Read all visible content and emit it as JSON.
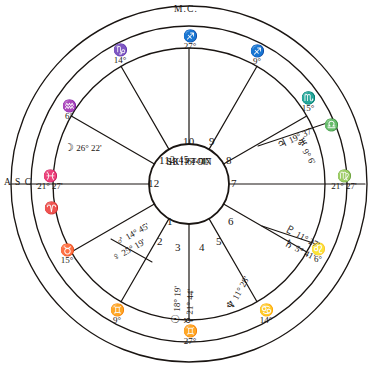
{
  "figure": {
    "ink_color": "#1a1512",
    "paper_color": "#ffffff"
  },
  "center": {
    "time": "2·45 a.m.",
    "date": "10 · 6 · 47",
    "place": "SKIPTON"
  },
  "angles": {
    "mc_label": "M.C.",
    "asc_label": "A S C ."
  },
  "house_numbers": [
    "1",
    "2",
    "3",
    "4",
    "5",
    "6",
    "7",
    "8",
    "9",
    "10",
    "11",
    "12"
  ],
  "cusps": [
    {
      "house": "10",
      "glyph": "♐",
      "degree": "27°",
      "name": "mc-sagittarius"
    },
    {
      "house": "11",
      "glyph": "♑",
      "degree": "14°",
      "name": "cusp-capricorn"
    },
    {
      "house": "12",
      "glyph": "♒",
      "degree": "6°",
      "name": "cusp-aquarius"
    },
    {
      "house": "1",
      "glyph": "♓",
      "degree": "21° 27'",
      "name": "asc-pisces"
    },
    {
      "house": "2",
      "glyph": "♈",
      "degree": "",
      "name": "cusp-aries"
    },
    {
      "house": "3",
      "glyph": "♉",
      "degree": "15°",
      "name": "cusp-taurus"
    },
    {
      "house": "4",
      "glyph": "♊",
      "degree": "9°",
      "name": "cusp-gemini-lower-left"
    },
    {
      "house": "4b",
      "glyph": "♊",
      "degree": "27°",
      "name": "ic-gemini"
    },
    {
      "house": "5",
      "glyph": "♋",
      "degree": "14°",
      "name": "cusp-cancer"
    },
    {
      "house": "6",
      "glyph": "♌",
      "degree": "6°",
      "name": "cusp-leo"
    },
    {
      "house": "7",
      "glyph": "♍",
      "degree": "21° 27'",
      "name": "desc-virgo"
    },
    {
      "house": "8",
      "glyph": "♎",
      "degree": "",
      "name": "cusp-libra"
    },
    {
      "house": "9",
      "glyph": "♏",
      "degree": "15°",
      "name": "cusp-scorpio"
    },
    {
      "house": "9b",
      "glyph": "♐",
      "degree": "9°",
      "name": "cusp-sagittarius-upper-right"
    }
  ],
  "planets": [
    {
      "name": "moon",
      "glyph": "☽",
      "position": "26° 22'",
      "house": "12"
    },
    {
      "name": "mars",
      "glyph": "♂",
      "position": "14° 45'",
      "house": "2"
    },
    {
      "name": "venus",
      "glyph": "♀",
      "position": "25° 19'",
      "house": "2"
    },
    {
      "name": "sun",
      "glyph": "☉",
      "position": "18° 19'",
      "house": "3"
    },
    {
      "name": "mercury",
      "glyph": "☿",
      "position": "21° 44'",
      "house": "3"
    },
    {
      "name": "neptune",
      "glyph": "♆",
      "position": "11° 28'",
      "house": "4"
    },
    {
      "name": "pluto",
      "glyph": "♇",
      "position": "11° 27'",
      "house": "5"
    },
    {
      "name": "saturn",
      "glyph": "♄",
      "position": "5° 41'",
      "house": "5"
    },
    {
      "name": "jupiter",
      "glyph": "♃",
      "position": "19° 37'",
      "house": "8"
    },
    {
      "name": "uranus",
      "glyph": "♅",
      "position": "9° 6'",
      "house": "8"
    }
  ]
}
